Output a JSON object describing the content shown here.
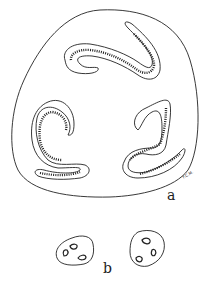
{
  "figure": {
    "panel_a_label": "a",
    "panel_b_label": "b",
    "signature": "F.C.M.",
    "line_color": "#222222",
    "background": "#ffffff"
  }
}
